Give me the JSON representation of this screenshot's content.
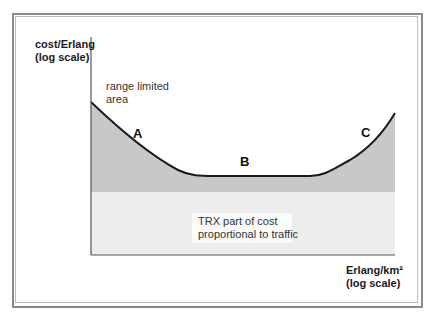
{
  "diagram": {
    "y_axis_label": [
      "cost/Erlang",
      "(log scale)"
    ],
    "x_axis_label": [
      "Erlang/km²",
      "(log scale)"
    ],
    "annotations": {
      "range_limited": [
        "range limited",
        "area"
      ],
      "trx_part": [
        "TRX part of cost",
        "proportional to traffic"
      ]
    },
    "curve_markers": [
      "A",
      "B",
      "C"
    ],
    "colors": {
      "frame": "#8a8a8a",
      "upper_fill": "#c8c8c8",
      "lower_fill": "#ededed",
      "curve": "#1a1a1a",
      "axis": "#555555"
    }
  }
}
